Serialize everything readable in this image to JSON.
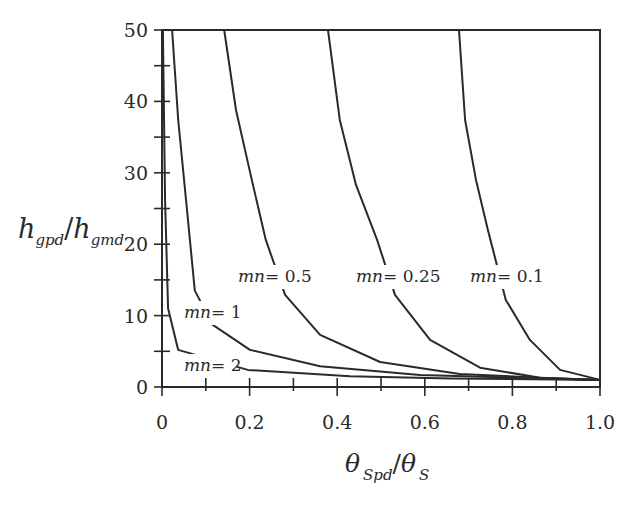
{
  "chart_data": {
    "type": "line",
    "title": "",
    "xlabel": "θ_Spd/θ_S",
    "ylabel": "h_gpd/h_gmd",
    "xlim": [
      0,
      1.0
    ],
    "ylim": [
      0,
      50
    ],
    "grid": false,
    "legend_position": "inline labels",
    "x_ticks": [
      "0",
      "0.2",
      "0.4",
      "0.6",
      "0.8",
      "1.0"
    ],
    "y_ticks": [
      "0",
      "10",
      "20",
      "30",
      "40",
      "50"
    ],
    "series": [
      {
        "name": "mn= 2",
        "x": [
          0.002,
          0.007,
          0.014,
          0.037,
          0.196,
          0.429,
          0.658,
          1.0
        ],
        "y": [
          50,
          26,
          11,
          5.2,
          2.4,
          1.5,
          1.2,
          1.0
        ]
      },
      {
        "name": "mn= 1",
        "x": [
          0.023,
          0.037,
          0.055,
          0.075,
          0.116,
          0.201,
          0.361,
          0.589,
          0.817,
          1.0
        ],
        "y": [
          50,
          37.4,
          26.1,
          13.5,
          8.7,
          5.2,
          2.9,
          1.7,
          1.3,
          1.0
        ]
      },
      {
        "name": "mn= 0.5",
        "x": [
          0.142,
          0.169,
          0.205,
          0.237,
          0.281,
          0.361,
          0.498,
          0.68,
          0.863,
          1.0
        ],
        "y": [
          50,
          38.8,
          29.0,
          20.6,
          12.9,
          7.3,
          3.5,
          1.8,
          1.3,
          1.0
        ]
      },
      {
        "name": "mn= 0.25",
        "x": [
          0.379,
          0.406,
          0.443,
          0.491,
          0.532,
          0.612,
          0.726,
          0.863,
          1.0
        ],
        "y": [
          50,
          37.4,
          28.3,
          20.6,
          12.9,
          6.6,
          2.7,
          1.3,
          1.0
        ]
      },
      {
        "name": "mn= 0.1",
        "x": [
          0.678,
          0.692,
          0.717,
          0.744,
          0.785,
          0.84,
          0.909,
          1.0
        ],
        "y": [
          50,
          37.4,
          29.0,
          22.0,
          12.2,
          6.6,
          2.4,
          1.0
        ]
      }
    ]
  },
  "labels": {
    "y_title_main": "h",
    "y_title_sub1": "gpd",
    "y_title_slash": "/",
    "y_title_main2": "h",
    "y_title_sub2": "gmd",
    "x_title_main": "θ",
    "x_title_sub1": "Spd",
    "x_title_slash": "/",
    "x_title_main2": "θ",
    "x_title_sub2": "S",
    "curves": [
      {
        "text": "mn= 0.5",
        "x": 238,
        "y": 282
      },
      {
        "text": "mn= 0.25",
        "x": 356,
        "y": 282
      },
      {
        "text": "mn= 0.1",
        "x": 470,
        "y": 282
      },
      {
        "text": "mn= 1",
        "x": 184,
        "y": 318
      },
      {
        "text": "mn= 2",
        "x": 184,
        "y": 371
      }
    ]
  },
  "colors": {
    "line": "#2a2a2a",
    "background": "#ffffff"
  }
}
